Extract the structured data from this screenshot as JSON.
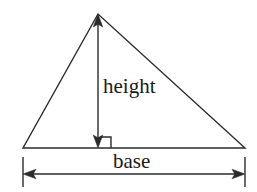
{
  "figure": {
    "name": "triangle-area-diagram",
    "background_color": "#ffffff",
    "stroke_color": "#2b2b2b",
    "text_color": "#1a1a1a",
    "labels": {
      "height": "height",
      "base": "base"
    },
    "icons": {
      "right_angle": "right-angle-marker-icon",
      "arrow_up": "arrow-up-icon",
      "arrow_down": "arrow-down-icon",
      "arrow_left": "arrow-left-icon",
      "arrow_right": "arrow-right-icon"
    },
    "geometry": {
      "apex": [
        98,
        14
      ],
      "bottom_left": [
        23,
        148
      ],
      "bottom_right": [
        245,
        148
      ],
      "height_line_x": 98,
      "height_line_top_y": 14,
      "height_line_bottom_y": 148,
      "right_angle_square": [
        100,
        137,
        111,
        148
      ],
      "base_dimension_y": 174,
      "base_dimension_left_x": 23,
      "base_dimension_right_x": 245,
      "extension_tick_top_y": 157,
      "extension_tick_bottom_y": 187
    }
  }
}
